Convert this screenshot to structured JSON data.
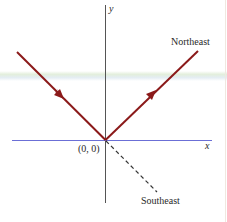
{
  "diagram": {
    "axes": {
      "x_label": "x",
      "y_label": "y",
      "origin_label": "(0, 0)",
      "x_axis_color": "#6b6fd6",
      "y_axis_color": "#555555"
    },
    "paths": [
      {
        "name": "incoming",
        "direction": "toward origin from upper-left",
        "color": "#8b1a1a",
        "style": "solid",
        "arrow": true
      },
      {
        "name": "northeast",
        "label": "Northeast",
        "direction": "away from origin toward upper-right",
        "color": "#8b1a1a",
        "style": "solid",
        "arrow": true
      },
      {
        "name": "southeast",
        "label": "Southeast",
        "direction": "away from origin toward lower-right",
        "color": "#333333",
        "style": "dashed",
        "arrow": false
      }
    ],
    "labels": {
      "northeast": "Northeast",
      "southeast": "Southeast"
    }
  }
}
